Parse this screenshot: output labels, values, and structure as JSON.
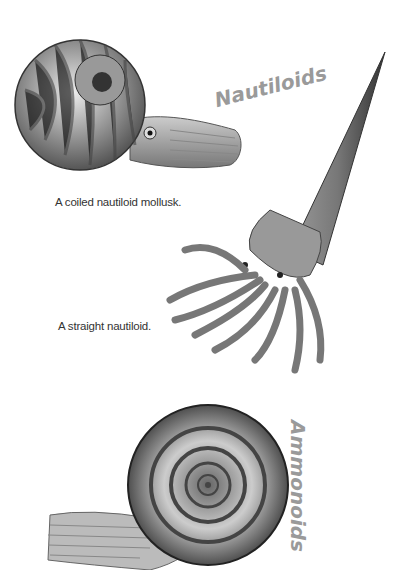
{
  "labels": {
    "nautiloids_title": "Nautiloids",
    "ammonoids_title": "Ammonoids",
    "coiled_caption": "A coiled nautiloid mollusk.",
    "straight_caption": "A straight nautiloid."
  },
  "illustrations": [
    {
      "name": "coiled-nautiloid",
      "description": "Striped coiled shell with tentacled body and eye"
    },
    {
      "name": "straight-nautiloid",
      "description": "Long conical straight shell with many tentacles"
    },
    {
      "name": "ammonoid",
      "description": "Smooth spiral shell with tentacled head"
    }
  ],
  "colors": {
    "title_gray": "#9a9a9a",
    "caption": "#333333",
    "background": "#ffffff"
  }
}
